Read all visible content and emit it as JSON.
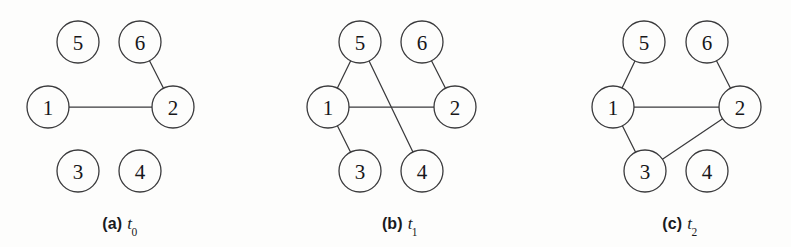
{
  "figure": {
    "width": 791,
    "height": 247,
    "background_color": "#fdfdfc",
    "stroke_color": "#3a3a3c",
    "label_color": "#17171a",
    "node_radius": 21
  },
  "panels": [
    {
      "id": "panel-a",
      "caption_tag": "(a)",
      "caption_var": "t",
      "caption_sub": "0",
      "caption_x": 120,
      "caption_y": 215,
      "nodes": [
        {
          "id": "5",
          "label": "5",
          "cx": 78,
          "cy": 42
        },
        {
          "id": "6",
          "label": "6",
          "cx": 140,
          "cy": 42
        },
        {
          "id": "1",
          "label": "1",
          "cx": 48,
          "cy": 107
        },
        {
          "id": "2",
          "label": "2",
          "cx": 173,
          "cy": 107
        },
        {
          "id": "3",
          "label": "3",
          "cx": 78,
          "cy": 171
        },
        {
          "id": "4",
          "label": "4",
          "cx": 140,
          "cy": 171
        }
      ],
      "edges": [
        {
          "from": "1",
          "to": "2"
        },
        {
          "from": "6",
          "to": "2"
        }
      ]
    },
    {
      "id": "panel-b",
      "caption_tag": "(b)",
      "caption_var": "t",
      "caption_sub": "1",
      "caption_x": 400,
      "caption_y": 215,
      "nodes": [
        {
          "id": "5",
          "label": "5",
          "cx": 360,
          "cy": 42
        },
        {
          "id": "6",
          "label": "6",
          "cx": 422,
          "cy": 42
        },
        {
          "id": "1",
          "label": "1",
          "cx": 328,
          "cy": 107
        },
        {
          "id": "2",
          "label": "2",
          "cx": 455,
          "cy": 107
        },
        {
          "id": "3",
          "label": "3",
          "cx": 360,
          "cy": 171
        },
        {
          "id": "4",
          "label": "4",
          "cx": 422,
          "cy": 171
        }
      ],
      "edges": [
        {
          "from": "1",
          "to": "5"
        },
        {
          "from": "1",
          "to": "2"
        },
        {
          "from": "1",
          "to": "3"
        },
        {
          "from": "5",
          "to": "4"
        },
        {
          "from": "6",
          "to": "2"
        }
      ]
    },
    {
      "id": "panel-c",
      "caption_tag": "(c)",
      "caption_var": "t",
      "caption_sub": "2",
      "caption_x": 680,
      "caption_y": 215,
      "nodes": [
        {
          "id": "5",
          "label": "5",
          "cx": 644,
          "cy": 42
        },
        {
          "id": "6",
          "label": "6",
          "cx": 707,
          "cy": 42
        },
        {
          "id": "1",
          "label": "1",
          "cx": 613,
          "cy": 107
        },
        {
          "id": "2",
          "label": "2",
          "cx": 740,
          "cy": 107
        },
        {
          "id": "3",
          "label": "3",
          "cx": 645,
          "cy": 171
        },
        {
          "id": "4",
          "label": "4",
          "cx": 707,
          "cy": 171
        }
      ],
      "edges": [
        {
          "from": "1",
          "to": "5"
        },
        {
          "from": "1",
          "to": "2"
        },
        {
          "from": "1",
          "to": "3"
        },
        {
          "from": "3",
          "to": "2"
        },
        {
          "from": "6",
          "to": "2"
        }
      ]
    }
  ]
}
